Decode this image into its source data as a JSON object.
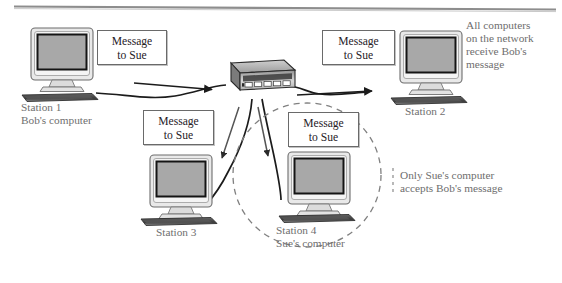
{
  "figure": {
    "type": "network-diagram",
    "top_rule": true
  },
  "stations": [
    {
      "id": "station-1",
      "label_line1": "Station 1",
      "label_line2": "Bob's computer",
      "x": 30,
      "y": 27
    },
    {
      "id": "station-2",
      "label_line1": "Station 2",
      "label_line2": "",
      "x": 400,
      "y": 30
    },
    {
      "id": "station-3",
      "label_line1": "Station 3",
      "label_line2": "",
      "x": 152,
      "y": 155
    },
    {
      "id": "station-4",
      "label_line1": "Station 4",
      "label_line2": "Sue's computer",
      "x": 290,
      "y": 152
    }
  ],
  "hub": {
    "label": "",
    "device_name": "network-hub",
    "port_count": 5
  },
  "message_boxes": [
    {
      "id": "msg-1",
      "line1": "Message",
      "line2": "to Sue"
    },
    {
      "id": "msg-2",
      "line1": "Message",
      "line2": "to Sue"
    },
    {
      "id": "msg-3",
      "line1": "Message",
      "line2": "to Sue"
    },
    {
      "id": "msg-4",
      "line1": "Message",
      "line2": "to Sue"
    }
  ],
  "notes": {
    "broadcast": {
      "line1": "All computers",
      "line2": "on the network",
      "line3": "receive Bob's",
      "line4": "message"
    },
    "accept": {
      "line1": "Only Sue's computer",
      "line2": "accepts Bob's message"
    }
  },
  "highlight": {
    "shape": "dashed-circle",
    "encloses": "station-4"
  },
  "colors": {
    "line": "#1b1b1b",
    "caption_text": "#6f6f6f",
    "box_text": "#26211f",
    "box_border": "#6a6a6a",
    "screen_fill": "#a8a8a8",
    "case_fill": "#e9e9e9",
    "background": "#ffffff",
    "rule": "#8d8d8d"
  }
}
